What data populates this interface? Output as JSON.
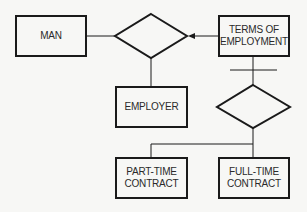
{
  "diagram": {
    "entities": {
      "man": {
        "label": "MAN"
      },
      "terms": {
        "line1": "TERMS OF",
        "line2": "EMPLOYMENT"
      },
      "employer": {
        "label": "EMPLOYER"
      },
      "part_time": {
        "line1": "PART-TIME",
        "line2": "CONTRACT"
      },
      "full_time": {
        "line1": "FULL-TIME",
        "line2": "CONTRACT"
      }
    },
    "relationships": [
      "employment-relationship-diamond",
      "contract-type-diamond"
    ],
    "colors": {
      "stroke": "#1a1a1a",
      "background": "#f7f7f5",
      "text": "#2a2a2a"
    }
  }
}
